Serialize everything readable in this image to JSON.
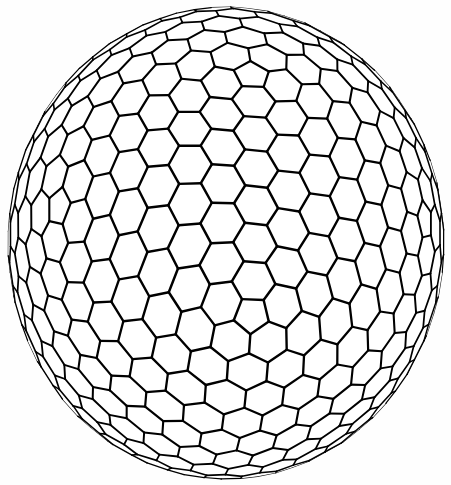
{
  "figure": {
    "render_style": "line-drawing",
    "background_color": "#fefefe",
    "line_color_front": "#000000",
    "line_color_back": "#1a1a1a",
    "face_color": "#ffffff",
    "canvas": {
      "width": 451,
      "height": 485
    }
  },
  "geometry": {
    "polyhedron_class": "Goldberg",
    "symmetry": "Ih",
    "goldberg_m": 7,
    "goldberg_n": 0,
    "pentagon_count": 12,
    "hexagon_count": 480,
    "vertex_count": 980,
    "edge_count": 1470,
    "projection": "orthographic",
    "center_x": 226,
    "center_y": 243,
    "radius_x": 218,
    "radius_y": 236,
    "rotation_x_deg": -14,
    "rotation_y_deg": 8,
    "rotation_z_deg": 0
  },
  "stroke_weights": {
    "front_min": 1.05,
    "front_max": 2.5,
    "back_min": 0.55,
    "back_max": 1.15
  },
  "bounds": {
    "left": 9,
    "right": 443,
    "top": 8,
    "bottom": 478
  }
}
